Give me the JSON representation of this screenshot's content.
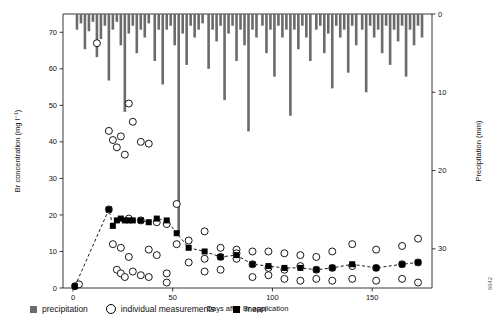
{
  "chart_data": {
    "type": "scatter",
    "title": "",
    "xlabel": "Days after Br application",
    "ylabel": "Br concentration (mg l⁻¹)",
    "y2label": "Precipitation (mm)",
    "xlim": [
      -5,
      180
    ],
    "ylim": [
      0,
      75
    ],
    "y2lim": [
      0,
      35
    ],
    "xticks": [
      0,
      50,
      100,
      150
    ],
    "yticks": [
      0,
      10,
      20,
      30,
      40,
      50,
      60,
      70
    ],
    "y2ticks": [
      0,
      10,
      20,
      30
    ],
    "grid": false,
    "legend_position": "bottom-left",
    "series": [
      {
        "name": "precipitation",
        "type": "bar",
        "axis": "y2",
        "color": "#6b6b6b",
        "points": [
          {
            "x": 2,
            "v": 2.0
          },
          {
            "x": 4,
            "v": 1.2
          },
          {
            "x": 6,
            "v": 4.5
          },
          {
            "x": 8,
            "v": 2.2
          },
          {
            "x": 10,
            "v": 1.0
          },
          {
            "x": 12,
            "v": 5.5
          },
          {
            "x": 14,
            "v": 3.2
          },
          {
            "x": 16,
            "v": 1.5
          },
          {
            "x": 18,
            "v": 8.5
          },
          {
            "x": 20,
            "v": 2.0
          },
          {
            "x": 22,
            "v": 1.0
          },
          {
            "x": 24,
            "v": 4.0
          },
          {
            "x": 26,
            "v": 12.5
          },
          {
            "x": 28,
            "v": 2.5
          },
          {
            "x": 30,
            "v": 1.5
          },
          {
            "x": 32,
            "v": 5.0
          },
          {
            "x": 34,
            "v": 2.0
          },
          {
            "x": 36,
            "v": 3.0
          },
          {
            "x": 38,
            "v": 1.2
          },
          {
            "x": 41,
            "v": 6.0
          },
          {
            "x": 43,
            "v": 2.0
          },
          {
            "x": 45,
            "v": 9.0
          },
          {
            "x": 47,
            "v": 2.0
          },
          {
            "x": 49,
            "v": 1.5
          },
          {
            "x": 51,
            "v": 4.0
          },
          {
            "x": 53,
            "v": 28.0
          },
          {
            "x": 55,
            "v": 2.5
          },
          {
            "x": 57,
            "v": 6.5
          },
          {
            "x": 59,
            "v": 1.5
          },
          {
            "x": 61,
            "v": 3.0
          },
          {
            "x": 63,
            "v": 2.0
          },
          {
            "x": 65,
            "v": 1.2
          },
          {
            "x": 68,
            "v": 7.0
          },
          {
            "x": 70,
            "v": 2.0
          },
          {
            "x": 72,
            "v": 3.5
          },
          {
            "x": 74,
            "v": 1.5
          },
          {
            "x": 76,
            "v": 11.0
          },
          {
            "x": 78,
            "v": 2.5
          },
          {
            "x": 80,
            "v": 1.5
          },
          {
            "x": 82,
            "v": 6.0
          },
          {
            "x": 84,
            "v": 2.0
          },
          {
            "x": 86,
            "v": 4.0
          },
          {
            "x": 88,
            "v": 15.0
          },
          {
            "x": 90,
            "v": 2.0
          },
          {
            "x": 92,
            "v": 3.0
          },
          {
            "x": 95,
            "v": 1.5
          },
          {
            "x": 97,
            "v": 5.0
          },
          {
            "x": 99,
            "v": 2.0
          },
          {
            "x": 101,
            "v": 8.0
          },
          {
            "x": 103,
            "v": 1.5
          },
          {
            "x": 105,
            "v": 3.0
          },
          {
            "x": 107,
            "v": 2.0
          },
          {
            "x": 109,
            "v": 13.0
          },
          {
            "x": 111,
            "v": 2.0
          },
          {
            "x": 113,
            "v": 4.5
          },
          {
            "x": 115,
            "v": 1.5
          },
          {
            "x": 117,
            "v": 3.0
          },
          {
            "x": 119,
            "v": 6.0
          },
          {
            "x": 122,
            "v": 2.0
          },
          {
            "x": 124,
            "v": 1.5
          },
          {
            "x": 126,
            "v": 5.0
          },
          {
            "x": 128,
            "v": 2.5
          },
          {
            "x": 130,
            "v": 9.5
          },
          {
            "x": 132,
            "v": 1.5
          },
          {
            "x": 134,
            "v": 3.0
          },
          {
            "x": 136,
            "v": 2.0
          },
          {
            "x": 138,
            "v": 7.5
          },
          {
            "x": 140,
            "v": 1.5
          },
          {
            "x": 142,
            "v": 4.0
          },
          {
            "x": 145,
            "v": 2.0
          },
          {
            "x": 147,
            "v": 10.0
          },
          {
            "x": 149,
            "v": 1.5
          },
          {
            "x": 151,
            "v": 3.0
          },
          {
            "x": 153,
            "v": 2.0
          },
          {
            "x": 155,
            "v": 5.0
          },
          {
            "x": 157,
            "v": 1.5
          },
          {
            "x": 159,
            "v": 6.5
          },
          {
            "x": 161,
            "v": 2.0
          },
          {
            "x": 163,
            "v": 3.5
          },
          {
            "x": 165,
            "v": 1.5
          },
          {
            "x": 167,
            "v": 8.0
          },
          {
            "x": 169,
            "v": 2.0
          },
          {
            "x": 171,
            "v": 4.0
          },
          {
            "x": 173,
            "v": 1.5
          },
          {
            "x": 175,
            "v": 3.0
          }
        ]
      },
      {
        "name": "individual measurements",
        "type": "scatter",
        "axis": "y1",
        "marker": "open-circle",
        "color": "#000000",
        "points": [
          {
            "x": 1,
            "y": 0.5
          },
          {
            "x": 3,
            "y": 1.0
          },
          {
            "x": 12,
            "y": 67.0
          },
          {
            "x": 18,
            "y": 43.0
          },
          {
            "x": 18,
            "y": 21.5
          },
          {
            "x": 20,
            "y": 40.5
          },
          {
            "x": 20,
            "y": 12.0
          },
          {
            "x": 22,
            "y": 38.5
          },
          {
            "x": 22,
            "y": 5.0
          },
          {
            "x": 24,
            "y": 41.5
          },
          {
            "x": 24,
            "y": 11.0
          },
          {
            "x": 24,
            "y": 4.0
          },
          {
            "x": 26,
            "y": 36.5
          },
          {
            "x": 26,
            "y": 3.0
          },
          {
            "x": 28,
            "y": 50.5
          },
          {
            "x": 28,
            "y": 19.0
          },
          {
            "x": 28,
            "y": 8.5
          },
          {
            "x": 30,
            "y": 45.5
          },
          {
            "x": 30,
            "y": 4.5
          },
          {
            "x": 34,
            "y": 40.0
          },
          {
            "x": 34,
            "y": 18.5
          },
          {
            "x": 34,
            "y": 3.5
          },
          {
            "x": 38,
            "y": 39.5
          },
          {
            "x": 38,
            "y": 10.5
          },
          {
            "x": 38,
            "y": 3.0
          },
          {
            "x": 42,
            "y": 18.0
          },
          {
            "x": 42,
            "y": 9.0
          },
          {
            "x": 47,
            "y": 17.5
          },
          {
            "x": 47,
            "y": 4.0
          },
          {
            "x": 47,
            "y": 1.5
          },
          {
            "x": 52,
            "y": 23.0
          },
          {
            "x": 52,
            "y": 12.0
          },
          {
            "x": 58,
            "y": 13.0
          },
          {
            "x": 58,
            "y": 7.0
          },
          {
            "x": 66,
            "y": 15.5
          },
          {
            "x": 66,
            "y": 8.0
          },
          {
            "x": 66,
            "y": 4.5
          },
          {
            "x": 74,
            "y": 11.0
          },
          {
            "x": 74,
            "y": 8.5
          },
          {
            "x": 74,
            "y": 5.0
          },
          {
            "x": 82,
            "y": 10.5
          },
          {
            "x": 82,
            "y": 9.5
          },
          {
            "x": 82,
            "y": 8.0
          },
          {
            "x": 90,
            "y": 10.0
          },
          {
            "x": 90,
            "y": 6.5
          },
          {
            "x": 90,
            "y": 3.0
          },
          {
            "x": 98,
            "y": 10.0
          },
          {
            "x": 98,
            "y": 5.5
          },
          {
            "x": 98,
            "y": 3.5
          },
          {
            "x": 106,
            "y": 9.5
          },
          {
            "x": 106,
            "y": 5.0
          },
          {
            "x": 106,
            "y": 2.5
          },
          {
            "x": 114,
            "y": 9.0
          },
          {
            "x": 114,
            "y": 6.0
          },
          {
            "x": 114,
            "y": 2.0
          },
          {
            "x": 122,
            "y": 8.5
          },
          {
            "x": 122,
            "y": 5.0
          },
          {
            "x": 122,
            "y": 2.5
          },
          {
            "x": 130,
            "y": 10.0
          },
          {
            "x": 130,
            "y": 5.5
          },
          {
            "x": 130,
            "y": 2.0
          },
          {
            "x": 140,
            "y": 12.0
          },
          {
            "x": 140,
            "y": 6.0
          },
          {
            "x": 140,
            "y": 2.5
          },
          {
            "x": 152,
            "y": 10.5
          },
          {
            "x": 152,
            "y": 5.5
          },
          {
            "x": 152,
            "y": 2.0
          },
          {
            "x": 165,
            "y": 11.5
          },
          {
            "x": 165,
            "y": 6.5
          },
          {
            "x": 165,
            "y": 2.5
          },
          {
            "x": 173,
            "y": 13.5
          },
          {
            "x": 173,
            "y": 7.0
          },
          {
            "x": 173,
            "y": 1.5
          }
        ]
      },
      {
        "name": "mean",
        "type": "line-marker",
        "axis": "y1",
        "marker": "filled-square",
        "color": "#000000",
        "linestyle": "dashed",
        "points": [
          {
            "x": 1,
            "y": 0.5
          },
          {
            "x": 18,
            "y": 21.5
          },
          {
            "x": 20,
            "y": 17.0
          },
          {
            "x": 22,
            "y": 18.5
          },
          {
            "x": 24,
            "y": 19.0
          },
          {
            "x": 26,
            "y": 18.5
          },
          {
            "x": 28,
            "y": 18.5
          },
          {
            "x": 30,
            "y": 18.5
          },
          {
            "x": 34,
            "y": 18.5
          },
          {
            "x": 38,
            "y": 18.0
          },
          {
            "x": 42,
            "y": 19.0
          },
          {
            "x": 47,
            "y": 18.5
          },
          {
            "x": 52,
            "y": 15.0
          },
          {
            "x": 58,
            "y": 11.0
          },
          {
            "x": 66,
            "y": 10.0
          },
          {
            "x": 74,
            "y": 8.5
          },
          {
            "x": 82,
            "y": 9.0
          },
          {
            "x": 90,
            "y": 6.5
          },
          {
            "x": 98,
            "y": 6.0
          },
          {
            "x": 106,
            "y": 5.5
          },
          {
            "x": 114,
            "y": 5.5
          },
          {
            "x": 122,
            "y": 5.0
          },
          {
            "x": 130,
            "y": 5.5
          },
          {
            "x": 140,
            "y": 6.5
          },
          {
            "x": 152,
            "y": 5.5
          },
          {
            "x": 165,
            "y": 6.5
          },
          {
            "x": 173,
            "y": 7.0
          }
        ]
      }
    ]
  },
  "legend": {
    "items": [
      {
        "label": "precipitation",
        "marker": "square-gray"
      },
      {
        "label": "individual measurements",
        "marker": "open-circle"
      },
      {
        "label": "mean",
        "marker": "square-black"
      }
    ]
  },
  "axes": {
    "x_title": "Days after Br application",
    "y_title": "Br concentration (mg l⁻¹)",
    "y2_title": "Precipitation (mm)",
    "x_ticks": [
      "0",
      "50",
      "100",
      "150"
    ],
    "y_ticks": [
      "0",
      "10",
      "20",
      "30",
      "40",
      "50",
      "60",
      "70"
    ],
    "y2_ticks": [
      "0",
      "10",
      "20",
      "30"
    ]
  },
  "corner_code": "6642"
}
